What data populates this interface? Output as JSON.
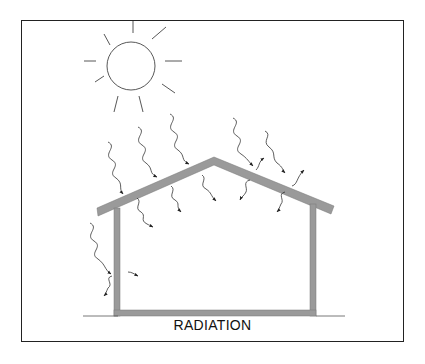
{
  "title": "RADIATION",
  "colors": {
    "wall": "#9a9a9a",
    "ink": "#222222",
    "frame": "#222222"
  },
  "elements": {
    "sun": "sun-icon",
    "house": "house-cross-section",
    "incoming_rays": 7,
    "reradiated_rays": 10
  }
}
